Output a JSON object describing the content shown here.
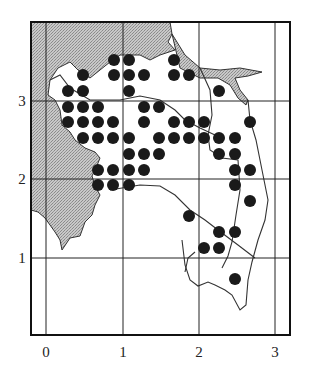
{
  "map": {
    "type": "grid distribution map",
    "x_axis": {
      "ticks": [
        "0",
        "1",
        "2",
        "3"
      ]
    },
    "y_axis": {
      "ticks": [
        "1",
        "2",
        "3"
      ]
    },
    "colors": {
      "sea_fill": "#b9b9b9",
      "land_fill": "#ffffff",
      "dot": "#1a1a1a",
      "grid": "#222222"
    },
    "dot_count": 59
  }
}
